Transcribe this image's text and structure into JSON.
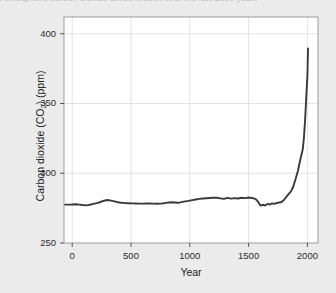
{
  "caption": {
    "text": "Atmospheric carbon dioxide concentration over the last 2000 years"
  },
  "colors": {
    "background": "#ebebeb",
    "plot_background": "#ffffff",
    "line": "#3a3a3a",
    "grid": "#e3e3e3",
    "frame": "#9b9b9b",
    "axis": "#555555",
    "text": "#1c1c1c"
  },
  "axes": {
    "y_title_main": "Carbon dioxide (CO",
    "y_title_sub": "2",
    "y_title_tail": ") (ppm)",
    "y_title_full": "Carbon dioxide (CO2) (ppm)",
    "x_title": "Year",
    "y_ticks": [
      "250",
      "300",
      "350",
      "400"
    ],
    "x_ticks": [
      "0",
      "500",
      "1000",
      "1500",
      "2000"
    ]
  },
  "chart_data": {
    "type": "line",
    "title": "",
    "xlabel": "Year",
    "ylabel": "Carbon dioxide (CO2) (ppm)",
    "xlim": [
      -70,
      2090
    ],
    "ylim": [
      250,
      412
    ],
    "grid": true,
    "legend": "none",
    "x_ticks": [
      0,
      500,
      1000,
      1500,
      2000
    ],
    "y_ticks": [
      250,
      300,
      350,
      400
    ],
    "series": [
      {
        "name": "Atmospheric CO2",
        "color": "#3a3a3a",
        "x": [
          -60,
          0,
          30,
          60,
          90,
          120,
          150,
          180,
          210,
          240,
          270,
          300,
          330,
          360,
          390,
          420,
          450,
          480,
          510,
          540,
          570,
          600,
          630,
          660,
          690,
          720,
          750,
          780,
          810,
          840,
          870,
          900,
          930,
          960,
          990,
          1020,
          1050,
          1080,
          1110,
          1140,
          1170,
          1200,
          1230,
          1260,
          1290,
          1320,
          1350,
          1380,
          1410,
          1440,
          1470,
          1500,
          1530,
          1560,
          1580,
          1600,
          1620,
          1640,
          1660,
          1680,
          1700,
          1720,
          1740,
          1760,
          1780,
          1800,
          1820,
          1840,
          1860,
          1880,
          1900,
          1920,
          1940,
          1960,
          1970,
          1980,
          1990,
          2000,
          2005
        ],
        "y": [
          277.5,
          277.6,
          277.8,
          277.5,
          277.2,
          277.0,
          277.4,
          278.0,
          278.6,
          279.4,
          280.3,
          280.8,
          280.4,
          279.8,
          279.2,
          278.8,
          278.6,
          278.5,
          278.4,
          278.3,
          278.2,
          278.2,
          278.3,
          278.3,
          278.2,
          278.1,
          278.2,
          278.5,
          278.9,
          279.2,
          279.0,
          278.8,
          279.3,
          279.8,
          280.2,
          280.7,
          281.2,
          281.6,
          281.9,
          282.1,
          282.3,
          282.5,
          282.4,
          282.0,
          281.6,
          282.3,
          281.8,
          282.2,
          281.9,
          282.4,
          282.2,
          282.6,
          282.3,
          281.4,
          279.6,
          276.8,
          277.4,
          276.9,
          278.0,
          277.6,
          278.4,
          278.0,
          278.7,
          279.0,
          279.4,
          280.8,
          283.0,
          285.0,
          287.0,
          290.5,
          296.0,
          302.0,
          310.0,
          317.0,
          325.0,
          338.0,
          354.0,
          370.0,
          389.5
        ]
      }
    ]
  },
  "plot_geometry": {
    "left": 64,
    "top": 17,
    "right": 318,
    "bottom": 243
  }
}
